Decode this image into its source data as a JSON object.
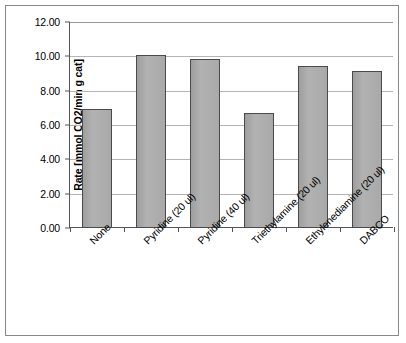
{
  "chart_data": {
    "type": "bar",
    "title": "",
    "xlabel": "",
    "ylabel": "Rate [mmol CO2/min g cat]",
    "categories": [
      "None",
      "Pyridine (20 ul)",
      "Pyridine (40 ul)",
      "Triethylamine (20 ul)",
      "Ethylenediamine (20 ul)",
      "DABCO"
    ],
    "values": [
      6.95,
      10.1,
      9.85,
      6.7,
      9.45,
      9.15
    ],
    "ylim": [
      0,
      12
    ],
    "ytick_labels": [
      "12.00",
      "10.00",
      "8.00",
      "6.00",
      "4.00",
      "2.00",
      "0.00"
    ],
    "ytick_values": [
      12,
      10,
      8,
      6,
      4,
      2,
      0
    ],
    "grid": true,
    "legend": "none",
    "bar_fill_color": "#a8a8a8",
    "bar_border_color": "#4a4a4a",
    "gridline_color": "#b4b4b4",
    "axis_color": "#555555",
    "frame_color": "#888888",
    "background_color": "#ffffff"
  }
}
